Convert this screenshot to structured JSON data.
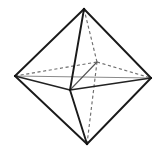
{
  "figure": {
    "shape_name": "octahedron",
    "background_color": "#ffffff",
    "visible_edge_color": "#1a1a1a",
    "hidden_edge_color": "#6e6e6e",
    "axis_color": "#8a8a8a",
    "vertex_count": 6,
    "edge_count": 12,
    "face_count": 8,
    "vertices": [
      {
        "id": "top-apex",
        "label": "top apex",
        "x": 84,
        "y": 9
      },
      {
        "id": "bottom-apex",
        "label": "bottom apex",
        "x": 87,
        "y": 144
      },
      {
        "id": "left",
        "label": "left equatorial",
        "x": 15,
        "y": 76
      },
      {
        "id": "right",
        "label": "right equatorial",
        "x": 151,
        "y": 78
      },
      {
        "id": "front",
        "label": "front equatorial",
        "x": 70,
        "y": 90
      },
      {
        "id": "back",
        "label": "back equatorial",
        "x": 97,
        "y": 62
      }
    ],
    "edges_visible": [
      {
        "from": "top-apex",
        "to": "left",
        "x1": 84,
        "y1": 9,
        "x2": 15,
        "y2": 76
      },
      {
        "from": "top-apex",
        "to": "right",
        "x1": 84,
        "y1": 9,
        "x2": 151,
        "y2": 78
      },
      {
        "from": "top-apex",
        "to": "front",
        "x1": 84,
        "y1": 9,
        "x2": 70,
        "y2": 90
      },
      {
        "from": "bottom-apex",
        "to": "left",
        "x1": 87,
        "y1": 144,
        "x2": 15,
        "y2": 76
      },
      {
        "from": "bottom-apex",
        "to": "right",
        "x1": 87,
        "y1": 144,
        "x2": 151,
        "y2": 78
      },
      {
        "from": "bottom-apex",
        "to": "front",
        "x1": 87,
        "y1": 144,
        "x2": 70,
        "y2": 90
      },
      {
        "from": "left",
        "to": "front",
        "x1": 15,
        "y1": 76,
        "x2": 70,
        "y2": 90
      },
      {
        "from": "front",
        "to": "right",
        "x1": 70,
        "y1": 90,
        "x2": 151,
        "y2": 78
      }
    ],
    "edges_hidden": [
      {
        "from": "top-apex",
        "to": "back",
        "x1": 84,
        "y1": 9,
        "x2": 97,
        "y2": 62
      },
      {
        "from": "bottom-apex",
        "to": "back",
        "x1": 87,
        "y1": 144,
        "x2": 97,
        "y2": 62
      },
      {
        "from": "left",
        "to": "back",
        "x1": 15,
        "y1": 76,
        "x2": 97,
        "y2": 62
      },
      {
        "from": "back",
        "to": "right",
        "x1": 97,
        "y1": 62,
        "x2": 151,
        "y2": 78
      }
    ],
    "axes_internal": [
      {
        "id": "axis-horizontal",
        "label": "left-right diagonal",
        "x1": 15,
        "y1": 76,
        "x2": 151,
        "y2": 78
      },
      {
        "id": "axis-depth",
        "label": "front-back diagonal",
        "x1": 70,
        "y1": 90,
        "x2": 97,
        "y2": 62
      }
    ]
  }
}
